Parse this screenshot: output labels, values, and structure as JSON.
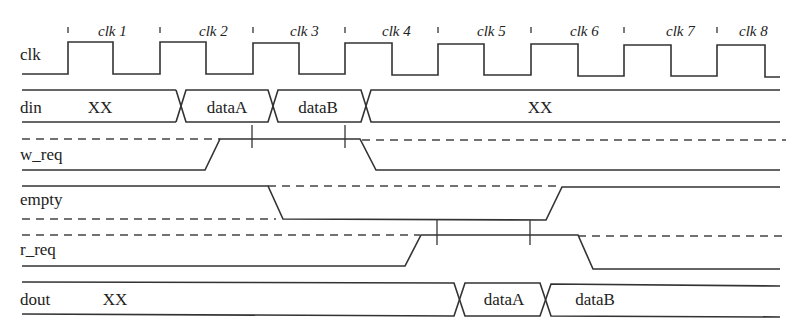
{
  "diagram": {
    "type": "timing-diagram",
    "signals": [
      {
        "name": "clk"
      },
      {
        "name": "din"
      },
      {
        "name": "w_req"
      },
      {
        "name": "empty"
      },
      {
        "name": "r_req"
      },
      {
        "name": "dout"
      }
    ],
    "clock_cycles": [
      "clk 1",
      "clk 2",
      "clk 3",
      "clk 4",
      "clk 5",
      "clk 6",
      "clk 7",
      "clk 8"
    ],
    "din_values": [
      "XX",
      "dataA",
      "dataB",
      "XX"
    ],
    "dout_values": [
      "XX",
      "dataA",
      "dataB"
    ],
    "colors": {
      "line": "#333333",
      "text": "#222222",
      "background": "#ffffff"
    }
  }
}
